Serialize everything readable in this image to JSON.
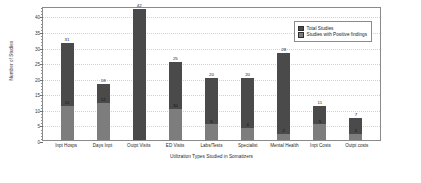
{
  "chart_data": {
    "type": "bar",
    "subtype": "stacked-bar",
    "title": "",
    "xlabel": "Utilization Types Studied in Somatizers",
    "ylabel": "Number of Studies",
    "ylim": [
      0,
      43
    ],
    "yticks": [
      0,
      5,
      10,
      15,
      20,
      25,
      30,
      35,
      40
    ],
    "grid": true,
    "legend_position": "top-right",
    "categories": [
      "Inpt Hosps",
      "Days Inpt",
      "Outpt Visits",
      "ED Visits",
      "Labs/Tests",
      "Specialist",
      "Mental Health",
      "Inpt Costs",
      "Outpt costs"
    ],
    "series": [
      {
        "name": "Total Studies",
        "color": "#4a4a4a",
        "values": [
          31,
          18,
          42,
          25,
          20,
          20,
          28,
          11,
          7
        ]
      },
      {
        "name": "Studies with Positive findings",
        "color": "#7d7d7d",
        "values": [
          11,
          12,
          0,
          10,
          5,
          4,
          2,
          5,
          2
        ]
      }
    ],
    "total_labels": [
      "31",
      "18",
      "42",
      "25",
      "20",
      "20",
      "28",
      "11",
      "7"
    ],
    "positive_labels": [
      "11",
      "12",
      "",
      "10",
      "5",
      "4",
      "2",
      "5",
      "2"
    ]
  },
  "legend": {
    "items": [
      {
        "label": "Total Studies",
        "color": "#4a4a4a"
      },
      {
        "label": "Studies with Positive findings",
        "color": "#7d7d7d"
      }
    ]
  },
  "axes": {
    "y_title": "Number of Studies",
    "x_title": "Utilization Types Studied in Somatizers",
    "y_tick_labels": [
      "0",
      "5",
      "10",
      "15",
      "20",
      "25",
      "30",
      "35",
      "40"
    ]
  },
  "colors": {
    "total_studies": "#4a4a4a",
    "positive_findings": "#7d7d7d",
    "frame": "#8a8a8a",
    "grid": "#d2d2d2",
    "background": "#ffffff"
  }
}
